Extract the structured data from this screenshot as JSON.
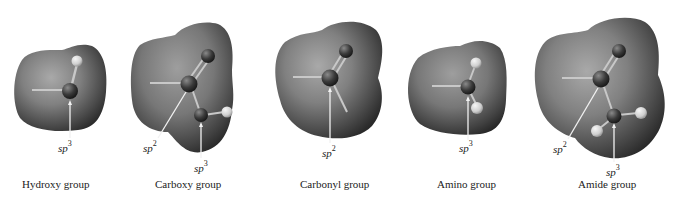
{
  "figure": {
    "groups": [
      {
        "id": "hydroxy",
        "name": "Hydroxy group",
        "label_x": 22,
        "hybridizations": [
          {
            "prefix": "sp",
            "exp": "3",
            "x": 58,
            "y": 140
          }
        ]
      },
      {
        "id": "carboxy",
        "name": "Carboxy group",
        "label_x": 155,
        "hybridizations": [
          {
            "prefix": "sp",
            "exp": "2",
            "x": 143,
            "y": 140
          },
          {
            "prefix": "sp",
            "exp": "3",
            "x": 194,
            "y": 160
          }
        ]
      },
      {
        "id": "carbonyl",
        "name": "Carbonyl group",
        "label_x": 300,
        "hybridizations": [
          {
            "prefix": "sp",
            "exp": "2",
            "x": 322,
            "y": 145
          }
        ]
      },
      {
        "id": "amino",
        "name": "Amino group",
        "label_x": 437,
        "hybridizations": [
          {
            "prefix": "sp",
            "exp": "3",
            "x": 459,
            "y": 140
          }
        ]
      },
      {
        "id": "amide",
        "name": "Amide group",
        "label_x": 578,
        "hybridizations": [
          {
            "prefix": "sp",
            "exp": "2",
            "x": 553,
            "y": 141
          },
          {
            "prefix": "sp",
            "exp": "3",
            "x": 606,
            "y": 164
          }
        ]
      }
    ],
    "colors": {
      "surface_light": "#a8a8a8",
      "surface_mid": "#7a7a7a",
      "surface_dark": "#2e2e2e",
      "heavy_atom": "#3c3c3c",
      "hydrogen_atom": "#e0e0e0",
      "bond": "#c8c8c8",
      "arrow": "#f2f2f2",
      "text": "#222222"
    }
  }
}
